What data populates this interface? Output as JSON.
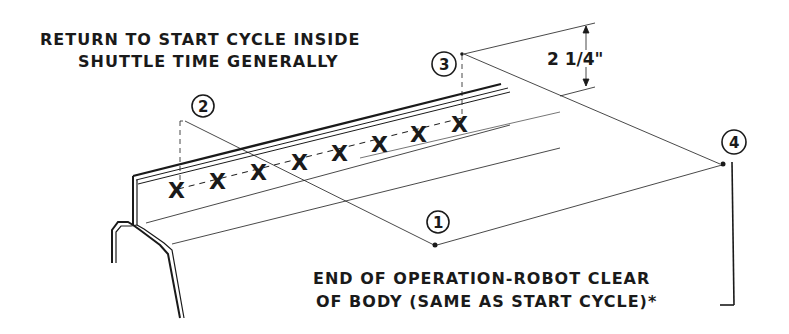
{
  "labels": {
    "top_note_line1": "RETURN TO START CYCLE INSIDE",
    "top_note_line2": "SHUTTLE TIME GENERALLY",
    "bottom_note_line1": "END OF OPERATION-ROBOT CLEAR",
    "bottom_note_line2": "OF BODY (SAME AS START CYCLE)*",
    "dimension": "2 1/4\""
  },
  "callouts": [
    {
      "id": "1",
      "label": "1"
    },
    {
      "id": "2",
      "label": "2"
    },
    {
      "id": "3",
      "label": "3"
    },
    {
      "id": "4",
      "label": "4"
    }
  ],
  "weld_marks": {
    "symbol": "X",
    "count": 8
  },
  "colors": {
    "ink": "#1a1a1a",
    "background": "#ffffff"
  }
}
